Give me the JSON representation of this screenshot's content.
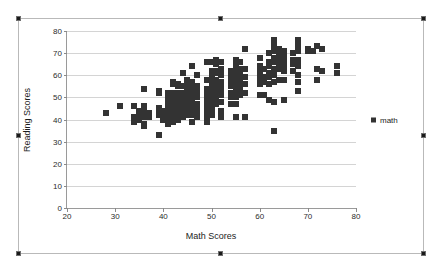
{
  "chart_object": {
    "selected": true,
    "handle_name": "selection-handle"
  },
  "chart_data": {
    "type": "scatter",
    "title": "",
    "xlabel": "Math Scores",
    "ylabel": "Reading Scores",
    "xlim": [
      20,
      80
    ],
    "ylim": [
      0,
      80
    ],
    "xticks": [
      20,
      30,
      40,
      50,
      60,
      70,
      80
    ],
    "yticks": [
      0,
      10,
      20,
      30,
      40,
      50,
      60,
      70,
      80
    ],
    "grid": "horizontal",
    "legend_position": "right",
    "marker_color": "#333333",
    "marker_shape": "square",
    "series": [
      {
        "name": "math",
        "points": [
          [
            28,
            43
          ],
          [
            31,
            46
          ],
          [
            34,
            46
          ],
          [
            34,
            41
          ],
          [
            34,
            40
          ],
          [
            34,
            39
          ],
          [
            35,
            44
          ],
          [
            35,
            42
          ],
          [
            35,
            41
          ],
          [
            35,
            40
          ],
          [
            36,
            54
          ],
          [
            36,
            46
          ],
          [
            36,
            44
          ],
          [
            36,
            43
          ],
          [
            36,
            41
          ],
          [
            36,
            38
          ],
          [
            36,
            37
          ],
          [
            37,
            43
          ],
          [
            37,
            41
          ],
          [
            39,
            53
          ],
          [
            39,
            52
          ],
          [
            39,
            45
          ],
          [
            39,
            44
          ],
          [
            39,
            42
          ],
          [
            39,
            33
          ],
          [
            40,
            44
          ],
          [
            40,
            42
          ],
          [
            40,
            41
          ],
          [
            40,
            40
          ],
          [
            41,
            52
          ],
          [
            41,
            51
          ],
          [
            41,
            49
          ],
          [
            41,
            48
          ],
          [
            41,
            46
          ],
          [
            41,
            44
          ],
          [
            41,
            43
          ],
          [
            41,
            42
          ],
          [
            41,
            40
          ],
          [
            41,
            38
          ],
          [
            42,
            57
          ],
          [
            42,
            56
          ],
          [
            42,
            52
          ],
          [
            42,
            50
          ],
          [
            42,
            49
          ],
          [
            42,
            47
          ],
          [
            42,
            46
          ],
          [
            42,
            45
          ],
          [
            42,
            44
          ],
          [
            42,
            43
          ],
          [
            42,
            41
          ],
          [
            42,
            39
          ],
          [
            43,
            56
          ],
          [
            43,
            55
          ],
          [
            43,
            52
          ],
          [
            43,
            51
          ],
          [
            43,
            50
          ],
          [
            43,
            48
          ],
          [
            43,
            47
          ],
          [
            43,
            46
          ],
          [
            43,
            45
          ],
          [
            43,
            44
          ],
          [
            43,
            42
          ],
          [
            43,
            40
          ],
          [
            44,
            61
          ],
          [
            44,
            55
          ],
          [
            44,
            52
          ],
          [
            44,
            51
          ],
          [
            44,
            50
          ],
          [
            44,
            49
          ],
          [
            44,
            48
          ],
          [
            44,
            47
          ],
          [
            44,
            46
          ],
          [
            44,
            45
          ],
          [
            44,
            44
          ],
          [
            44,
            43
          ],
          [
            44,
            41
          ],
          [
            45,
            58
          ],
          [
            45,
            55
          ],
          [
            45,
            53
          ],
          [
            45,
            51
          ],
          [
            45,
            50
          ],
          [
            45,
            49
          ],
          [
            45,
            47
          ],
          [
            45,
            46
          ],
          [
            45,
            44
          ],
          [
            45,
            42
          ],
          [
            46,
            64
          ],
          [
            46,
            57
          ],
          [
            46,
            56
          ],
          [
            46,
            55
          ],
          [
            46,
            54
          ],
          [
            46,
            53
          ],
          [
            46,
            51
          ],
          [
            46,
            50
          ],
          [
            46,
            48
          ],
          [
            46,
            46
          ],
          [
            46,
            44
          ],
          [
            46,
            42
          ],
          [
            46,
            39
          ],
          [
            47,
            60
          ],
          [
            47,
            55
          ],
          [
            47,
            53
          ],
          [
            47,
            52
          ],
          [
            47,
            50
          ],
          [
            47,
            47
          ],
          [
            47,
            45
          ],
          [
            47,
            43
          ],
          [
            47,
            41
          ],
          [
            49,
            66
          ],
          [
            49,
            58
          ],
          [
            49,
            54
          ],
          [
            49,
            52
          ],
          [
            49,
            50
          ],
          [
            49,
            48
          ],
          [
            49,
            45
          ],
          [
            49,
            43
          ],
          [
            49,
            41
          ],
          [
            49,
            39
          ],
          [
            50,
            66
          ],
          [
            50,
            62
          ],
          [
            50,
            60
          ],
          [
            50,
            58
          ],
          [
            50,
            55
          ],
          [
            50,
            53
          ],
          [
            50,
            52
          ],
          [
            50,
            50
          ],
          [
            50,
            48
          ],
          [
            50,
            46
          ],
          [
            50,
            44
          ],
          [
            50,
            42
          ],
          [
            51,
            67
          ],
          [
            51,
            65
          ],
          [
            51,
            62
          ],
          [
            51,
            61
          ],
          [
            51,
            58
          ],
          [
            51,
            56
          ],
          [
            51,
            55
          ],
          [
            51,
            53
          ],
          [
            51,
            51
          ],
          [
            51,
            49
          ],
          [
            51,
            47
          ],
          [
            52,
            66
          ],
          [
            52,
            63
          ],
          [
            52,
            62
          ],
          [
            52,
            60
          ],
          [
            52,
            57
          ],
          [
            52,
            55
          ],
          [
            52,
            53
          ],
          [
            52,
            51
          ],
          [
            52,
            48
          ],
          [
            52,
            44
          ],
          [
            52,
            41
          ],
          [
            54,
            62
          ],
          [
            54,
            59
          ],
          [
            54,
            57
          ],
          [
            54,
            55
          ],
          [
            54,
            52
          ],
          [
            54,
            50
          ],
          [
            54,
            47
          ],
          [
            55,
            67
          ],
          [
            55,
            64
          ],
          [
            55,
            62
          ],
          [
            55,
            60
          ],
          [
            55,
            59
          ],
          [
            55,
            57
          ],
          [
            55,
            56
          ],
          [
            55,
            54
          ],
          [
            55,
            52
          ],
          [
            55,
            50
          ],
          [
            55,
            47
          ],
          [
            55,
            41
          ],
          [
            56,
            66
          ],
          [
            56,
            63
          ],
          [
            56,
            61
          ],
          [
            56,
            59
          ],
          [
            56,
            57
          ],
          [
            56,
            55
          ],
          [
            56,
            53
          ],
          [
            56,
            51
          ],
          [
            57,
            72
          ],
          [
            57,
            63
          ],
          [
            57,
            59
          ],
          [
            57,
            56
          ],
          [
            57,
            52
          ],
          [
            57,
            41
          ],
          [
            60,
            68
          ],
          [
            60,
            64
          ],
          [
            60,
            62
          ],
          [
            60,
            60
          ],
          [
            60,
            58
          ],
          [
            60,
            56
          ],
          [
            60,
            51
          ],
          [
            61,
            63
          ],
          [
            61,
            59
          ],
          [
            61,
            57
          ],
          [
            61,
            51
          ],
          [
            62,
            70
          ],
          [
            62,
            66
          ],
          [
            62,
            64
          ],
          [
            62,
            61
          ],
          [
            62,
            59
          ],
          [
            62,
            56
          ],
          [
            62,
            49
          ],
          [
            63,
            76
          ],
          [
            63,
            73
          ],
          [
            63,
            71
          ],
          [
            63,
            68
          ],
          [
            63,
            66
          ],
          [
            63,
            63
          ],
          [
            63,
            60
          ],
          [
            63,
            57
          ],
          [
            63,
            48
          ],
          [
            63,
            35
          ],
          [
            64,
            72
          ],
          [
            64,
            69
          ],
          [
            64,
            67
          ],
          [
            64,
            65
          ],
          [
            64,
            63
          ],
          [
            64,
            58
          ],
          [
            65,
            71
          ],
          [
            65,
            69
          ],
          [
            65,
            67
          ],
          [
            65,
            65
          ],
          [
            65,
            64
          ],
          [
            65,
            62
          ],
          [
            65,
            58
          ],
          [
            65,
            49
          ],
          [
            67,
            70
          ],
          [
            67,
            67
          ],
          [
            67,
            65
          ],
          [
            67,
            62
          ],
          [
            68,
            76
          ],
          [
            68,
            73
          ],
          [
            68,
            71
          ],
          [
            68,
            67
          ],
          [
            68,
            64
          ],
          [
            68,
            60
          ],
          [
            68,
            57
          ],
          [
            68,
            53
          ],
          [
            70,
            72
          ],
          [
            70,
            71
          ],
          [
            71,
            71
          ],
          [
            72,
            73
          ],
          [
            72,
            63
          ],
          [
            72,
            58
          ],
          [
            73,
            72
          ],
          [
            73,
            62
          ],
          [
            76,
            64
          ],
          [
            76,
            61
          ]
        ]
      }
    ]
  }
}
